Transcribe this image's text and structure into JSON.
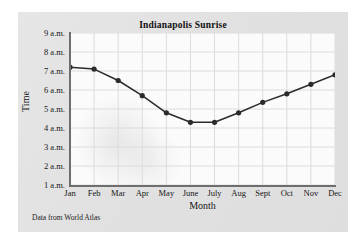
{
  "figure": {
    "source_note": "Data from World Atlas",
    "card_color": "#e3e3e3",
    "plot_background": "#fbfbfb",
    "axis_color": "#6e6e6e",
    "grid_color": "#dcdcdc",
    "series_color": "#2b2b2b"
  },
  "chart_data": {
    "type": "line",
    "title": "Indianapolis Sunrise",
    "xlabel": "Month",
    "ylabel": "Time",
    "categories": [
      "Jan",
      "Feb",
      "Mar",
      "Apr",
      "May",
      "June",
      "July",
      "Aug",
      "Sept",
      "Oct",
      "Nov",
      "Dec"
    ],
    "values": [
      7.2,
      7.1,
      6.5,
      5.7,
      4.8,
      4.3,
      4.3,
      4.8,
      5.35,
      5.8,
      6.3,
      6.8
    ],
    "ytick_labels": [
      "9 a.m.",
      "8 a.m.",
      "7 a.m.",
      "6 a.m.",
      "5 a.m.",
      "4 a.m.",
      "3 a.m.",
      "2 a.m.",
      "1 a.m."
    ],
    "ytick_values": [
      9,
      8,
      7,
      6,
      5,
      4,
      3,
      2,
      1
    ],
    "ylim": [
      1,
      9
    ],
    "grid": true,
    "legend": "none",
    "marker": "filled-circle"
  }
}
